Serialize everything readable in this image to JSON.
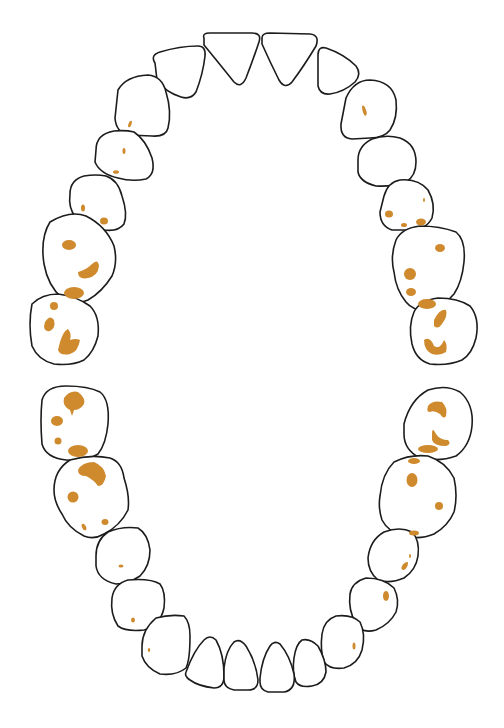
{
  "diagram": {
    "type": "dental-arch-odontogram",
    "stain_color": "#cf8a2e",
    "outline_color": "#1c1c1c",
    "arches": [
      {
        "name": "upper",
        "teeth": [
          {
            "id": "upper-left-molar-2",
            "stains": 4
          },
          {
            "id": "upper-left-molar-1",
            "stains": 3
          },
          {
            "id": "upper-left-premolar-2",
            "stains": 2
          },
          {
            "id": "upper-left-premolar-1",
            "stains": 2
          },
          {
            "id": "upper-left-canine",
            "stains": 1
          },
          {
            "id": "upper-left-lateral-incisor",
            "stains": 0
          },
          {
            "id": "upper-left-central-incisor",
            "stains": 0
          },
          {
            "id": "upper-right-central-incisor",
            "stains": 0
          },
          {
            "id": "upper-right-lateral-incisor",
            "stains": 0
          },
          {
            "id": "upper-right-canine",
            "stains": 1
          },
          {
            "id": "upper-right-premolar-1",
            "stains": 0
          },
          {
            "id": "upper-right-premolar-2",
            "stains": 4
          },
          {
            "id": "upper-right-molar-1",
            "stains": 4
          },
          {
            "id": "upper-right-molar-2",
            "stains": 2
          }
        ]
      },
      {
        "name": "lower",
        "teeth": [
          {
            "id": "lower-left-molar-2",
            "stains": 4
          },
          {
            "id": "lower-left-molar-1",
            "stains": 4
          },
          {
            "id": "lower-left-premolar-2",
            "stains": 1
          },
          {
            "id": "lower-left-premolar-1",
            "stains": 1
          },
          {
            "id": "lower-left-canine",
            "stains": 1
          },
          {
            "id": "lower-left-lateral-incisor",
            "stains": 0
          },
          {
            "id": "lower-left-central-incisor",
            "stains": 0
          },
          {
            "id": "lower-right-central-incisor",
            "stains": 0
          },
          {
            "id": "lower-right-lateral-incisor",
            "stains": 0
          },
          {
            "id": "lower-right-canine",
            "stains": 1
          },
          {
            "id": "lower-right-premolar-1",
            "stains": 1
          },
          {
            "id": "lower-right-premolar-2",
            "stains": 2
          },
          {
            "id": "lower-right-molar-1",
            "stains": 4
          },
          {
            "id": "lower-right-molar-2",
            "stains": 3
          }
        ]
      }
    ]
  }
}
